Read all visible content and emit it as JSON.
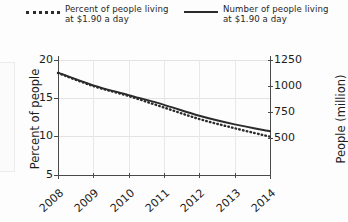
{
  "legend": {
    "entries": [
      {
        "marker": "dotted-line-marker",
        "label": "Percent of people living\nat $1.90 a day"
      },
      {
        "marker": "solid-line-marker",
        "label": "Number of people living\nat $1.90 a day"
      }
    ]
  },
  "axes": {
    "left_title": "Percent of people",
    "right_title": "People (million)",
    "left_ticks": [
      "20",
      "15",
      "10",
      "5"
    ],
    "right_ticks": [
      "1250",
      "1000",
      "750",
      "500"
    ],
    "x_ticks": [
      "2008",
      "2009",
      "2010",
      "2011",
      "2012",
      "2013",
      "2014"
    ]
  },
  "colors": {
    "line": "#2b2b2b",
    "axis": "#4a4a4a",
    "grid": "#e3e3e3",
    "background": "#fdfdfd"
  },
  "chart_data": {
    "type": "line",
    "title": "",
    "xlabel": "",
    "ylabel": "Percent of people",
    "y2label": "People (million)",
    "x": [
      2008,
      2009,
      2010,
      2011,
      2012,
      2013,
      2014
    ],
    "ylim": [
      5,
      20
    ],
    "y2lim": [
      375,
      1375
    ],
    "grid": true,
    "legend_position": "top",
    "series": [
      {
        "name": "Percent of people living at $1.90 a day",
        "style": "dotted",
        "axis": "left",
        "units": "percent",
        "values": [
          18.3,
          16.6,
          15.3,
          13.8,
          12.3,
          11.1,
          10.0
        ]
      },
      {
        "name": "Number of people living at $1.90 a day",
        "style": "solid",
        "axis": "right",
        "units": "million",
        "values": [
          1265,
          1155,
          1070,
          985,
          890,
          815,
          755
        ]
      }
    ]
  }
}
